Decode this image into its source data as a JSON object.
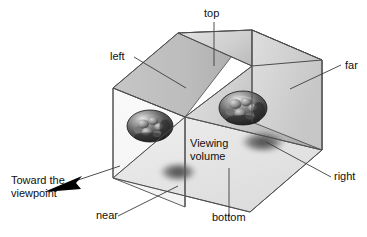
{
  "figure": {
    "type": "diagram"
  },
  "labels": {
    "top": "top",
    "left": "left",
    "far": "far",
    "right": "right",
    "near": "near",
    "bottom": "bottom",
    "viewing_volume_line1": "Viewing",
    "viewing_volume_line2": "volume",
    "toward_line1": "Toward the",
    "toward_line2": "viewpoint"
  },
  "colors": {
    "outline": "#4d4d4d",
    "leader": "#3c3c3c",
    "text": "#101010",
    "top_face_light": "#d8d8d8",
    "top_face_dark": "#a9a9a9",
    "back_face_light": "#c9c9c9",
    "back_face_dark": "#b0b0b0",
    "bottom_face": "#e6e6e6",
    "near_plane": "#efefef",
    "far_plane": "#e2e2e2",
    "sphere_dark": "#2a2a2a",
    "sphere_light": "#d7d7d7",
    "shadow": "#4a4a4a",
    "arrow": "#000000",
    "background": "#ffffff"
  },
  "geometry": {
    "box_vertices": {
      "top_near_left": "113,88",
      "top_far_left": "178,33",
      "top_apex": "252,30",
      "top_near_right": "322,60",
      "bottom_near_left": "113,178",
      "bottom_near_right": "250,212",
      "bottom_far_right": "322,150"
    },
    "spheres": [
      {
        "cx": 150,
        "cy": 126,
        "rx": 23,
        "ry": 16
      },
      {
        "cx": 243,
        "cy": 108,
        "rx": 24,
        "ry": 17
      }
    ],
    "shadows": [
      {
        "cx": 178,
        "cy": 172,
        "rx": 21,
        "ry": 11
      },
      {
        "cx": 263,
        "cy": 142,
        "rx": 25,
        "ry": 12
      }
    ]
  }
}
